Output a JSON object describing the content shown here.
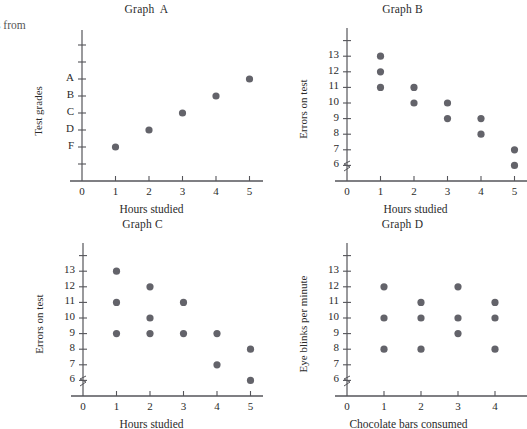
{
  "page": {
    "clipped_text": "s from",
    "dot_color": "#63636a",
    "axis_color": "#55555a"
  },
  "panels": [
    {
      "key": "a",
      "title": "Graph  A",
      "xlabel": "Hours studied",
      "ylabel": "Test grades",
      "xticks": [
        "0",
        "1",
        "2",
        "3",
        "4",
        "5"
      ],
      "yticks": [
        "A",
        "B",
        "C",
        "D",
        "F"
      ]
    },
    {
      "key": "b",
      "title": "Graph B",
      "xlabel": "Hours studied",
      "ylabel": "Errors on test",
      "xticks": [
        "0",
        "1",
        "2",
        "3",
        "4",
        "5"
      ],
      "yticks": [
        "13",
        "12",
        "11",
        "10",
        "9",
        "8",
        "7",
        "6"
      ]
    },
    {
      "key": "c",
      "title": "Graph C",
      "xlabel": "Hours studied",
      "ylabel": "Errors on test",
      "xticks": [
        "0",
        "1",
        "2",
        "3",
        "4",
        "5"
      ],
      "yticks": [
        "13",
        "12",
        "11",
        "10",
        "9",
        "8",
        "7",
        "6"
      ]
    },
    {
      "key": "d",
      "title": "Graph D",
      "xlabel": "Chocolate bars consumed",
      "ylabel": "Eye blinks per minute",
      "xticks": [
        "0",
        "1",
        "2",
        "3",
        "4"
      ],
      "yticks": [
        "13",
        "12",
        "11",
        "10",
        "9",
        "8",
        "7",
        "6"
      ]
    }
  ],
  "chart_data": [
    {
      "type": "scatter",
      "title": "Graph  A",
      "xlabel": "Hours studied",
      "ylabel": "Test grades",
      "xticks": [
        0,
        1,
        2,
        3,
        4,
        5
      ],
      "yticklabels": [
        "A",
        "B",
        "C",
        "D",
        "F"
      ],
      "ylim": [
        0,
        7
      ],
      "xlim": [
        0,
        6
      ],
      "grid": false,
      "legend": null,
      "axis_break": false,
      "points": [
        {
          "x": 1,
          "grade": "F"
        },
        {
          "x": 2,
          "grade": "D"
        },
        {
          "x": 3,
          "grade": "C"
        },
        {
          "x": 4,
          "grade": "B"
        },
        {
          "x": 5,
          "grade": "A"
        }
      ]
    },
    {
      "type": "scatter",
      "title": "Graph B",
      "xlabel": "Hours studied",
      "ylabel": "Errors on test",
      "xticks": [
        0,
        1,
        2,
        3,
        4,
        5
      ],
      "yticks": [
        6,
        7,
        8,
        9,
        10,
        11,
        12,
        13
      ],
      "ylim": [
        6,
        14
      ],
      "xlim": [
        0,
        6
      ],
      "grid": false,
      "legend": null,
      "axis_break": true,
      "points": [
        {
          "x": 1,
          "y": 13
        },
        {
          "x": 1,
          "y": 12
        },
        {
          "x": 1,
          "y": 11
        },
        {
          "x": 2,
          "y": 11
        },
        {
          "x": 2,
          "y": 10
        },
        {
          "x": 3,
          "y": 10
        },
        {
          "x": 3,
          "y": 9
        },
        {
          "x": 4,
          "y": 9
        },
        {
          "x": 4,
          "y": 8
        },
        {
          "x": 5,
          "y": 7
        },
        {
          "x": 5,
          "y": 6
        }
      ]
    },
    {
      "type": "scatter",
      "title": "Graph C",
      "xlabel": "Hours studied",
      "ylabel": "Errors on test",
      "xticks": [
        0,
        1,
        2,
        3,
        4,
        5
      ],
      "yticks": [
        6,
        7,
        8,
        9,
        10,
        11,
        12,
        13
      ],
      "ylim": [
        6,
        14
      ],
      "xlim": [
        0,
        6
      ],
      "grid": false,
      "legend": null,
      "axis_break": true,
      "points": [
        {
          "x": 1,
          "y": 13
        },
        {
          "x": 1,
          "y": 11
        },
        {
          "x": 1,
          "y": 9
        },
        {
          "x": 2,
          "y": 12
        },
        {
          "x": 2,
          "y": 10
        },
        {
          "x": 2,
          "y": 9
        },
        {
          "x": 3,
          "y": 11
        },
        {
          "x": 3,
          "y": 9
        },
        {
          "x": 4,
          "y": 9
        },
        {
          "x": 4,
          "y": 7
        },
        {
          "x": 5,
          "y": 8
        },
        {
          "x": 5,
          "y": 6
        }
      ]
    },
    {
      "type": "scatter",
      "title": "Graph D",
      "xlabel": "Chocolate bars consumed",
      "ylabel": "Eye blinks per minute",
      "xticks": [
        0,
        1,
        2,
        3,
        4
      ],
      "yticks": [
        6,
        7,
        8,
        9,
        10,
        11,
        12,
        13
      ],
      "ylim": [
        6,
        14
      ],
      "xlim": [
        0,
        5
      ],
      "grid": false,
      "legend": null,
      "axis_break": true,
      "points": [
        {
          "x": 1,
          "y": 12
        },
        {
          "x": 1,
          "y": 10
        },
        {
          "x": 1,
          "y": 8
        },
        {
          "x": 2,
          "y": 11
        },
        {
          "x": 2,
          "y": 10
        },
        {
          "x": 2,
          "y": 8
        },
        {
          "x": 3,
          "y": 12
        },
        {
          "x": 3,
          "y": 10
        },
        {
          "x": 3,
          "y": 9
        },
        {
          "x": 4,
          "y": 11
        },
        {
          "x": 4,
          "y": 10
        },
        {
          "x": 4,
          "y": 8
        }
      ]
    }
  ]
}
